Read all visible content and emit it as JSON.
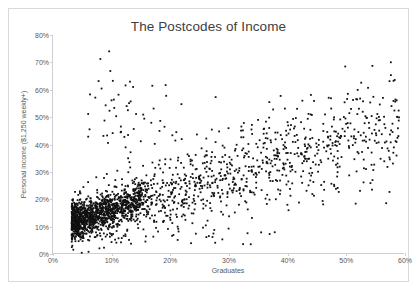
{
  "chart_data": {
    "type": "scatter",
    "title": "The Postcodes of Income",
    "xlabel": "Graduates",
    "ylabel": "Personal income ($1,250 weekly+)",
    "xlim": [
      0,
      60
    ],
    "ylim": [
      0,
      80
    ],
    "xticks": [
      "0%",
      "10%",
      "20%",
      "30%",
      "40%",
      "50%",
      "60%"
    ],
    "xtick_values": [
      0,
      10,
      20,
      30,
      40,
      50,
      60
    ],
    "yticks": [
      "0%",
      "10%",
      "20%",
      "30%",
      "40%",
      "50%",
      "60%",
      "70%",
      "80%"
    ],
    "ytick_values": [
      0,
      10,
      20,
      30,
      40,
      50,
      60,
      70,
      80
    ],
    "grid": false,
    "legend": false,
    "marker": "square",
    "marker_size": 1.8,
    "marker_color": "#111111",
    "axis_color": "#cfcfcf",
    "title_color": "#404040",
    "label_color": "#595959",
    "n_points": 1400,
    "series": [
      {
        "name": "Postcodes",
        "points": [
          [
            9.6,
            74.0
          ],
          [
            8.1,
            71.2
          ],
          [
            9.8,
            66.8
          ],
          [
            12.4,
            61.5
          ],
          [
            27.8,
            57.2
          ],
          [
            11.2,
            58.1
          ],
          [
            10.4,
            56.3
          ],
          [
            13.0,
            55.0
          ],
          [
            9.0,
            54.2
          ],
          [
            58.2,
            55.8
          ],
          [
            12.8,
            52.4
          ],
          [
            14.2,
            51.0
          ],
          [
            10.8,
            50.2
          ],
          [
            15.6,
            49.3
          ],
          [
            8.8,
            48.6
          ],
          [
            16.8,
            47.8
          ],
          [
            11.6,
            46.4
          ],
          [
            13.8,
            45.5
          ],
          [
            18.2,
            44.8
          ],
          [
            10.2,
            44.0
          ],
          [
            20.4,
            43.2
          ],
          [
            12.2,
            42.6
          ],
          [
            22.0,
            41.8
          ],
          [
            15.0,
            41.0
          ],
          [
            9.4,
            40.4
          ],
          [
            24.6,
            43.5
          ],
          [
            26.2,
            42.0
          ],
          [
            28.4,
            44.6
          ],
          [
            30.0,
            45.8
          ],
          [
            32.2,
            46.4
          ],
          [
            34.0,
            47.0
          ],
          [
            36.4,
            48.2
          ],
          [
            38.0,
            44.2
          ],
          [
            40.2,
            46.8
          ],
          [
            42.4,
            48.0
          ],
          [
            44.0,
            45.2
          ],
          [
            46.2,
            47.4
          ],
          [
            48.0,
            49.0
          ],
          [
            50.4,
            46.0
          ],
          [
            52.2,
            44.4
          ],
          [
            54.0,
            47.8
          ],
          [
            56.2,
            43.6
          ],
          [
            57.8,
            45.0
          ],
          [
            53.4,
            50.2
          ],
          [
            55.0,
            41.2
          ],
          [
            51.0,
            42.8
          ],
          [
            49.2,
            43.0
          ],
          [
            47.4,
            41.6
          ],
          [
            45.0,
            40.2
          ],
          [
            43.2,
            42.4
          ],
          [
            41.0,
            40.8
          ],
          [
            39.4,
            39.6
          ],
          [
            37.2,
            41.4
          ],
          [
            35.0,
            38.8
          ],
          [
            33.4,
            40.0
          ],
          [
            31.2,
            38.2
          ],
          [
            29.0,
            39.4
          ],
          [
            27.2,
            37.0
          ],
          [
            25.4,
            38.4
          ],
          [
            23.0,
            36.2
          ],
          [
            21.4,
            35.0
          ],
          [
            19.2,
            34.4
          ],
          [
            17.0,
            33.2
          ],
          [
            15.4,
            32.0
          ],
          [
            13.2,
            31.4
          ],
          [
            11.0,
            30.2
          ],
          [
            9.2,
            29.0
          ],
          [
            7.4,
            27.8
          ],
          [
            6.0,
            26.0
          ],
          [
            5.2,
            24.2
          ],
          [
            4.6,
            22.0
          ],
          [
            4.2,
            19.4
          ],
          [
            4.8,
            17.0
          ],
          [
            5.6,
            15.2
          ],
          [
            6.4,
            13.8
          ],
          [
            7.2,
            12.4
          ],
          [
            8.0,
            11.6
          ],
          [
            8.8,
            10.8
          ],
          [
            9.6,
            10.2
          ],
          [
            10.4,
            9.6
          ],
          [
            6.8,
            9.0
          ],
          [
            5.8,
            8.4
          ],
          [
            5.0,
            7.8
          ],
          [
            4.4,
            7.2
          ],
          [
            7.6,
            6.6
          ],
          [
            9.0,
            6.0
          ],
          [
            11.2,
            5.4
          ],
          [
            13.0,
            4.8
          ],
          [
            15.8,
            4.2
          ],
          [
            23.6,
            3.6
          ],
          [
            33.8,
            3.2
          ],
          [
            6.2,
            4.6
          ],
          [
            8.4,
            5.0
          ],
          [
            10.0,
            4.0
          ],
          [
            12.4,
            6.2
          ]
        ]
      }
    ]
  }
}
